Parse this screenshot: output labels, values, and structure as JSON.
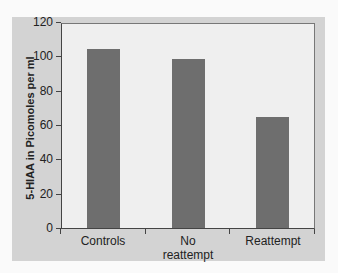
{
  "chart_data": {
    "type": "bar",
    "title": "",
    "xlabel": "",
    "ylabel": "5-HIAA in Picomoles per ml",
    "categories": [
      "Controls",
      "No reattempt",
      "Reattempt"
    ],
    "category_labels": [
      [
        "Controls"
      ],
      [
        "No",
        "reattempt"
      ],
      [
        "Reattempt"
      ]
    ],
    "values": [
      105,
      99,
      65
    ],
    "ylim": [
      0,
      120
    ],
    "yticks": [
      0,
      20,
      40,
      60,
      80,
      100,
      120
    ],
    "ytick_labels": [
      "0",
      "20",
      "40",
      "60",
      "80",
      "100",
      "120"
    ],
    "grid": false,
    "legend": null,
    "colors": {
      "bar": "#6e6e6e",
      "plot_background": "#efefef",
      "panel_background": "#d3d3d3"
    }
  }
}
